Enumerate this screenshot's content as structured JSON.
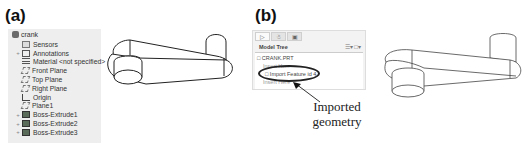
{
  "panels": {
    "a": {
      "label": "(a)",
      "tree": {
        "root": "crank",
        "items": [
          {
            "label": "Sensors",
            "icon": "sensor-icon",
            "expandable": false
          },
          {
            "label": "Annotations",
            "icon": "annotations-icon",
            "expandable": true
          },
          {
            "label": "Material <not specified>",
            "icon": "material-icon",
            "expandable": false
          },
          {
            "label": "Front Plane",
            "icon": "plane-icon",
            "expandable": false
          },
          {
            "label": "Top Plane",
            "icon": "plane-icon",
            "expandable": false
          },
          {
            "label": "Right Plane",
            "icon": "plane-icon",
            "expandable": false
          },
          {
            "label": "Origin",
            "icon": "origin-icon",
            "expandable": false
          },
          {
            "label": "Plane1",
            "icon": "plane-icon",
            "expandable": false
          },
          {
            "label": "Boss-Extrude1",
            "icon": "extrude-icon",
            "expandable": true
          },
          {
            "label": "Boss-Extrude2",
            "icon": "extrude-icon",
            "expandable": true
          },
          {
            "label": "Boss-Extrude3",
            "icon": "extrude-icon",
            "expandable": true
          }
        ]
      }
    },
    "b": {
      "label": "(b)",
      "tree": {
        "title": "Model Tree",
        "tools": "☰▾ □▾",
        "nodes": [
          {
            "label": "CRANK.PRT"
          },
          {
            "label": "Insert Here"
          },
          {
            "label": "Import Feature id 4"
          },
          {
            "label": "Insert Here"
          }
        ]
      },
      "callout": {
        "line1": "Imported",
        "line2": "geometry"
      }
    }
  }
}
